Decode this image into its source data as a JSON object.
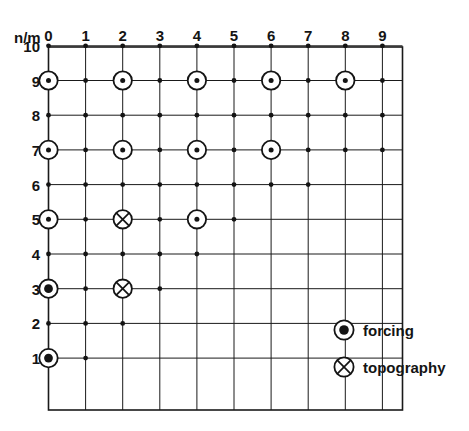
{
  "figure": {
    "corner_label": "n/m",
    "x_tick_labels": [
      "0",
      "1",
      "2",
      "3",
      "4",
      "5",
      "6",
      "7",
      "8",
      "9"
    ],
    "y_tick_labels": [
      "10",
      "9",
      "8",
      "7",
      "6",
      "5",
      "4",
      "3",
      "2",
      "1"
    ],
    "colors": {
      "ink": "#141414",
      "grid": "#1a1a1a",
      "background": "#ffffff"
    }
  },
  "legend": {
    "entries": [
      {
        "symbol": "filled-ring-icon",
        "label": "forcing"
      },
      {
        "symbol": "crossed-ring-icon",
        "label": "topography"
      }
    ]
  },
  "chart_data": {
    "type": "scatter",
    "title": "",
    "xlabel": "m",
    "ylabel": "n",
    "corner_label": "n/m",
    "grid": true,
    "legend_position": "right-middle",
    "xlim": [
      -0.3,
      9.5
    ],
    "ylim": [
      0.45,
      10.5
    ],
    "xticks": [
      0,
      1,
      2,
      3,
      4,
      5,
      6,
      7,
      8,
      9
    ],
    "yticks": [
      1,
      2,
      3,
      4,
      5,
      6,
      7,
      8,
      9,
      10
    ],
    "series": [
      {
        "name": "forcing",
        "marker": "filled-ring-icon",
        "points": [
          {
            "m": 0,
            "n": 9
          },
          {
            "m": 2,
            "n": 9
          },
          {
            "m": 4,
            "n": 9
          },
          {
            "m": 6,
            "n": 9
          },
          {
            "m": 8,
            "n": 9
          },
          {
            "m": 0,
            "n": 7
          },
          {
            "m": 2,
            "n": 7
          },
          {
            "m": 4,
            "n": 7
          },
          {
            "m": 6,
            "n": 7
          },
          {
            "m": 0,
            "n": 5
          },
          {
            "m": 4,
            "n": 5
          },
          {
            "m": 0,
            "n": 3
          },
          {
            "m": 0,
            "n": 1
          }
        ]
      },
      {
        "name": "topography",
        "marker": "crossed-ring-icon",
        "points": [
          {
            "m": 2,
            "n": 5
          },
          {
            "m": 2,
            "n": 3
          }
        ]
      }
    ],
    "lattice_nodes": [
      {
        "n": 10,
        "m_values": [
          0,
          1,
          2,
          3,
          4,
          5,
          6,
          7,
          8,
          9
        ]
      },
      {
        "n": 9,
        "m_values": [
          1,
          3,
          5,
          7,
          9
        ]
      },
      {
        "n": 8,
        "m_values": [
          0,
          1,
          2,
          3,
          4,
          5,
          6,
          7,
          8,
          9
        ]
      },
      {
        "n": 7,
        "m_values": [
          1,
          3,
          5,
          7,
          8,
          9
        ]
      },
      {
        "n": 6,
        "m_values": [
          0,
          1,
          2,
          3,
          4,
          5,
          6,
          7
        ]
      },
      {
        "n": 5,
        "m_values": [
          1,
          3,
          5
        ]
      },
      {
        "n": 4,
        "m_values": [
          0,
          1,
          2,
          3,
          4
        ]
      },
      {
        "n": 3,
        "m_values": [
          1,
          3
        ]
      },
      {
        "n": 2,
        "m_values": [
          0,
          1,
          2
        ]
      },
      {
        "n": 1,
        "m_values": [
          1
        ]
      }
    ]
  }
}
